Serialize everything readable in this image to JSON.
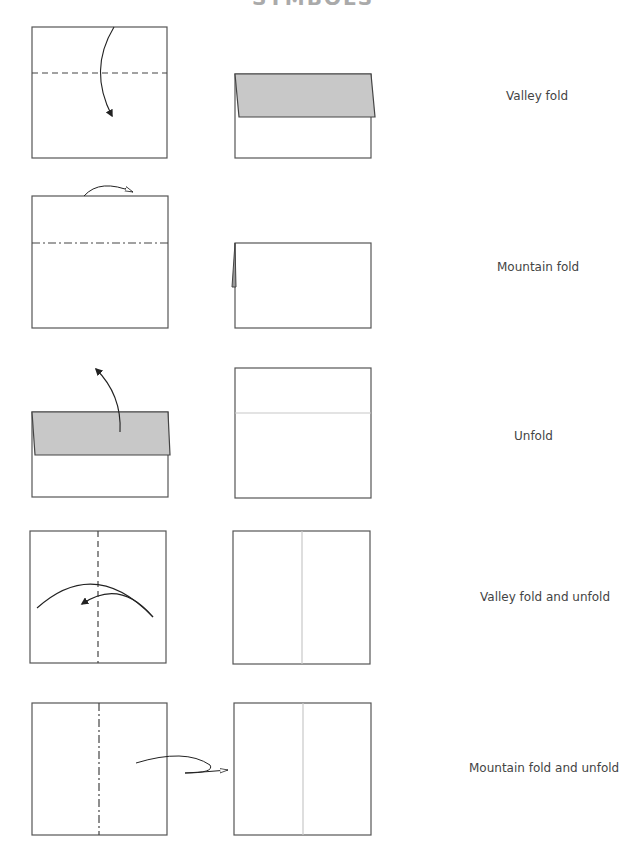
{
  "page": {
    "title_partial": "SYMBOLS",
    "colors": {
      "paper_outline": "#555555",
      "flap_fill": "#c8c8c8",
      "crease_line": "#c8c8c8",
      "arrow": "#222222",
      "label_text": "#444444"
    }
  },
  "rows": [
    {
      "label": "Valley fold",
      "before": {
        "shape": "square",
        "line": "dashed-horizontal",
        "arrow": "valley-arrow-down"
      },
      "after": {
        "shape": "folded-rect",
        "flap": "gray-top-flap"
      }
    },
    {
      "label": "Mountain fold",
      "before": {
        "shape": "square",
        "line": "dash-dot-horizontal",
        "arrow": "mountain-arrow-back"
      },
      "after": {
        "shape": "folded-rect",
        "flap": "flap-behind"
      }
    },
    {
      "label": "Unfold",
      "before": {
        "shape": "folded-rect",
        "flap": "gray-top-flap",
        "arrow": "unfold-arrow-up"
      },
      "after": {
        "shape": "square",
        "line": "crease-horizontal"
      }
    },
    {
      "label": "Valley fold and unfold",
      "before": {
        "shape": "square",
        "line": "dashed-vertical",
        "arrow": "fold-unfold-arrow"
      },
      "after": {
        "shape": "square",
        "line": "crease-vertical"
      }
    },
    {
      "label": "Mountain fold and unfold",
      "before": {
        "shape": "square",
        "line": "dash-dot-vertical",
        "arrow": "mountain-fold-unfold-arrow"
      },
      "after": {
        "shape": "square",
        "line": "crease-vertical"
      }
    }
  ]
}
